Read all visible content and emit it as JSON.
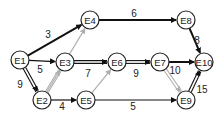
{
  "colors": {
    "edge": "#111111",
    "gray_edge": "#b0b0b0",
    "node_fill": "#ffffff",
    "node_stroke": "#222222"
  },
  "nodes": [
    {
      "id": "E1",
      "label": "E1",
      "x": 20,
      "y": 60
    },
    {
      "id": "E2",
      "label": "E2",
      "x": 42,
      "y": 100
    },
    {
      "id": "E3",
      "label": "E3",
      "x": 65,
      "y": 62
    },
    {
      "id": "E4",
      "label": "E4",
      "x": 90,
      "y": 20
    },
    {
      "id": "E5",
      "label": "E5",
      "x": 86,
      "y": 100
    },
    {
      "id": "E6",
      "label": "E6",
      "x": 117,
      "y": 62
    },
    {
      "id": "E7",
      "label": "E7",
      "x": 160,
      "y": 62
    },
    {
      "id": "E8",
      "label": "E8",
      "x": 186,
      "y": 20
    },
    {
      "id": "E9",
      "label": "E9",
      "x": 186,
      "y": 100
    },
    {
      "id": "E10",
      "label": "E10",
      "x": 204,
      "y": 62
    }
  ],
  "edges": [
    {
      "from": "E1",
      "to": "E4",
      "weight": "3",
      "style": "bold",
      "lx": 48,
      "ly": 38
    },
    {
      "from": "E1",
      "to": "E3",
      "weight": "5",
      "style": "single",
      "lx": 40,
      "ly": 73
    },
    {
      "from": "E1",
      "to": "E2",
      "weight": "9",
      "style": "double",
      "lx": 20,
      "ly": 88
    },
    {
      "from": "E2",
      "to": "E5",
      "weight": "4",
      "style": "single",
      "lx": 62,
      "ly": 110
    },
    {
      "from": "E3",
      "to": "E6",
      "weight": "7",
      "style": "double",
      "lx": 88,
      "ly": 77
    },
    {
      "from": "E4",
      "to": "E8",
      "weight": "6",
      "style": "bold",
      "lx": 134,
      "ly": 17
    },
    {
      "from": "E6",
      "to": "E7",
      "weight": "9",
      "style": "double",
      "lx": 136,
      "ly": 77
    },
    {
      "from": "E7",
      "to": "E10",
      "weight": "10",
      "style": "bold",
      "lx": 175,
      "ly": 74
    },
    {
      "from": "E8",
      "to": "E10",
      "weight": "8",
      "style": "bold",
      "lx": 197,
      "ly": 44
    },
    {
      "from": "E5",
      "to": "E9",
      "weight": "5",
      "style": "single",
      "lx": 133,
      "ly": 110
    },
    {
      "from": "E9",
      "to": "E10",
      "weight": "15",
      "style": "double",
      "lx": 202,
      "ly": 93
    },
    {
      "from": "E2",
      "to": "E3",
      "weight": "",
      "style": "gray-double"
    },
    {
      "from": "E2",
      "to": "E4",
      "weight": "",
      "style": "gray"
    },
    {
      "from": "E5",
      "to": "E6",
      "weight": "",
      "style": "gray"
    },
    {
      "from": "E7",
      "to": "E9",
      "weight": "",
      "style": "gray-double"
    }
  ]
}
